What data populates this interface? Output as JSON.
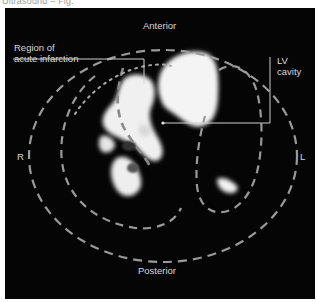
{
  "caption": {
    "text": "Ultrasound – Fig.",
    "note": "partially clipped, illegible"
  },
  "diagram": {
    "type": "cardiac short-axis scan (annotated)",
    "background_color": "#050505",
    "label_color": "#d8d8d8",
    "dash_color": "#9a9a9a",
    "orientation": {
      "top": "Anterior",
      "bottom": "Posterior",
      "left": "R",
      "right": "L"
    },
    "callouts": {
      "region": {
        "line1": "Region of",
        "line2": "acute infarction"
      },
      "lv": {
        "line1": "LV",
        "line2": "cavity"
      }
    },
    "outlines": [
      {
        "name": "outer-epicardial-boundary",
        "style": "dashed"
      },
      {
        "name": "right-ventricle-boundary",
        "style": "dashed"
      },
      {
        "name": "left-ventricle-boundary",
        "style": "dashed"
      },
      {
        "name": "infarct-region-boundary",
        "style": "dotted"
      }
    ]
  }
}
